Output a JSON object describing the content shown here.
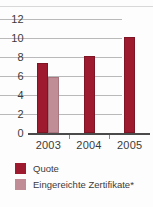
{
  "chart_data": {
    "type": "bar",
    "title": "",
    "subtitle": "",
    "xlabel": "",
    "ylabel": "",
    "categories": [
      "2003",
      "2004",
      "2005"
    ],
    "ylim": [
      0,
      12
    ],
    "yticks": [
      "0",
      "2",
      "4",
      "6",
      "8",
      "10",
      "12"
    ],
    "ytick_values": [
      0,
      2,
      4,
      6,
      8,
      10,
      12
    ],
    "grid": true,
    "legend_position": "below",
    "series": [
      {
        "name": "Quote",
        "color": "#9e1b2f",
        "values": [
          7.4,
          8.1,
          10.1
        ]
      },
      {
        "name": "Eingereichte Zertifikate*",
        "color": "#c08c95",
        "values": [
          5.9,
          null,
          null
        ]
      }
    ]
  },
  "legend": {
    "items": [
      {
        "label": "Quote",
        "color": "#9e1b2f"
      },
      {
        "label": "Eingereichte Zertifikate*",
        "color": "#c08c95"
      }
    ]
  },
  "colors": {
    "quote": "#9e1b2f",
    "zertifikate": "#c08c95",
    "gridline": "#b9b9b9",
    "axis": "#4a4a4a",
    "text": "#3b3b3b",
    "background": "#fdfdfd"
  }
}
